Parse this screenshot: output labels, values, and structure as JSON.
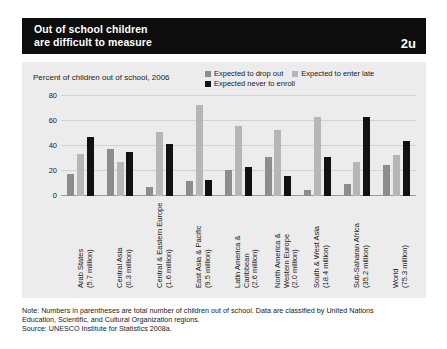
{
  "header": {
    "title": "Out of school children\nare difficult to measure",
    "badge": "2u"
  },
  "chart_data": {
    "type": "bar",
    "title": "Out of school children are difficult to measure",
    "subtitle": "Percent of children out of school, 2006",
    "xlabel": "",
    "ylabel": "Percent of children out of school, 2006",
    "ylim": [
      0,
      80
    ],
    "yticks": [
      "0",
      "20",
      "40",
      "60",
      "80"
    ],
    "grid": true,
    "legend_position": "top-right",
    "categories": [
      "Arab States\n(5.7 million)",
      "Central Asia\n(0.3 million)",
      "Central & Eastern Europe\n(1.6 million)",
      "East Asia & Pacific\n(9.5 million)",
      "Latin America & Caribbean\n(2.6 million)",
      "North America &\nWestern Europe\n(2.0 million)",
      "South & West Asia\n(18.4 million)",
      "Sub-Saharan Africa\n(35.2 million)",
      "World\n(75.3 million)"
    ],
    "series": [
      {
        "name": "Expected to drop out",
        "color": "#8c8c8c",
        "values": [
          18,
          38,
          7,
          12,
          21,
          31,
          5,
          10,
          25
        ]
      },
      {
        "name": "Expected to enter late",
        "color": "#b6b6b6",
        "values": [
          34,
          27,
          51,
          73,
          56,
          53,
          63,
          27,
          33
        ]
      },
      {
        "name": "Expected never to enroll",
        "color": "#111111",
        "values": [
          47,
          35,
          42,
          13,
          23,
          16,
          31,
          63,
          44
        ]
      }
    ]
  },
  "note": {
    "line1": "Note: Numbers in parentheses are total number of children out of school. Data are classified by United Nations\nEducation, Scientific, and Cultural Organization regions.",
    "line2": "Source: UNESCO Institute for Statistics 2008a."
  }
}
